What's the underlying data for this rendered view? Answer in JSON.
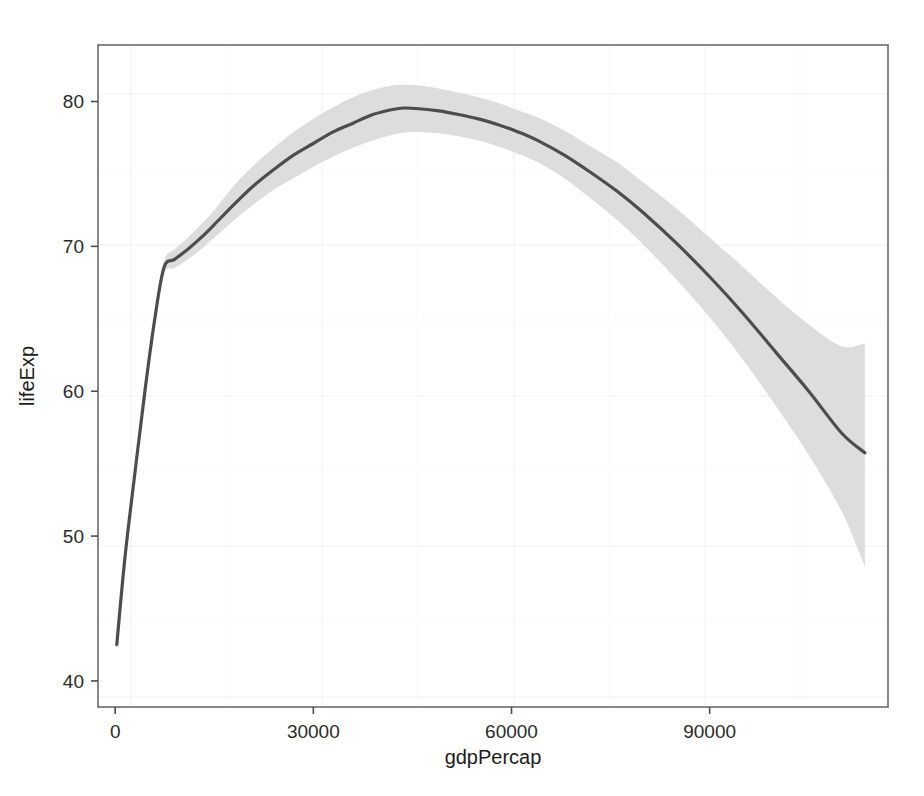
{
  "figure": {
    "background_color": "#ffffff",
    "panel_background_color": "#ffffff",
    "panel_border_color": "#6b6b6b"
  },
  "chart_data": {
    "type": "line",
    "title": "",
    "subtitle": "",
    "xlabel": "gdpPercap",
    "ylabel": "lifeExp",
    "xlim": [
      -2600,
      117000
    ],
    "ylim": [
      38.2,
      83.9
    ],
    "xticks": [
      0,
      30000,
      60000,
      90000
    ],
    "xtick_labels": [
      "0",
      "30000",
      "60000",
      "90000"
    ],
    "yticks": [
      40,
      50,
      60,
      70,
      80
    ],
    "ytick_labels": [
      "40",
      "50",
      "60",
      "70",
      "80"
    ],
    "grid": "faint major and minor gridlines, white-on-white",
    "legend": "none",
    "line_color": "#4d4d4d",
    "line_width": 3.0,
    "ribbon_color": "#d9d9d9",
    "ribbon_opacity": 0.85,
    "series": [
      {
        "name": "loess smooth (fit)",
        "x": [
          241,
          1500,
          3000,
          4500,
          6000,
          7400,
          9000,
          11000,
          13000,
          15000,
          18000,
          21000,
          24000,
          27000,
          30000,
          33000,
          36000,
          39000,
          42000,
          43700,
          46000,
          49000,
          52000,
          55000,
          58000,
          61000,
          64000,
          68000,
          72000,
          76000,
          80000,
          85000,
          90000,
          95000,
          100000,
          105000,
          110000,
          113500
        ],
        "y": [
          42.5,
          48.6,
          54.4,
          60.0,
          65.0,
          68.55,
          69.1,
          69.8,
          70.6,
          71.5,
          72.9,
          74.2,
          75.3,
          76.3,
          77.1,
          77.9,
          78.5,
          79.1,
          79.45,
          79.55,
          79.5,
          79.35,
          79.1,
          78.8,
          78.4,
          77.9,
          77.3,
          76.3,
          75.1,
          73.8,
          72.3,
          70.2,
          67.9,
          65.4,
          62.7,
          60.0,
          57.1,
          55.75
        ]
      },
      {
        "name": "confidence band upper (ymax)",
        "x": [
          241,
          1500,
          3000,
          4500,
          6000,
          7400,
          9000,
          11000,
          13000,
          15000,
          18000,
          21000,
          24000,
          27000,
          30000,
          33000,
          36000,
          39000,
          42000,
          43700,
          46000,
          49000,
          52000,
          55000,
          58000,
          61000,
          64000,
          68000,
          72000,
          76000,
          80000,
          85000,
          90000,
          95000,
          100000,
          105000,
          110000,
          113500
        ],
        "y": [
          42.6,
          48.8,
          54.6,
          60.3,
          65.4,
          69.0,
          69.8,
          70.6,
          71.5,
          72.5,
          74.2,
          75.6,
          76.8,
          77.9,
          78.8,
          79.6,
          80.3,
          80.8,
          81.1,
          81.15,
          81.1,
          80.9,
          80.6,
          80.3,
          79.9,
          79.4,
          78.9,
          78.0,
          76.9,
          75.8,
          74.4,
          72.6,
          70.6,
          68.6,
          66.5,
          64.6,
          63.1,
          63.3
        ]
      },
      {
        "name": "confidence band lower (ymin)",
        "x": [
          241,
          1500,
          3000,
          4500,
          6000,
          7400,
          9000,
          11000,
          13000,
          15000,
          18000,
          21000,
          24000,
          27000,
          30000,
          33000,
          36000,
          39000,
          42000,
          43700,
          46000,
          49000,
          52000,
          55000,
          58000,
          61000,
          64000,
          68000,
          72000,
          76000,
          80000,
          85000,
          90000,
          95000,
          100000,
          105000,
          110000,
          113500
        ],
        "y": [
          42.4,
          48.4,
          54.2,
          59.7,
          64.6,
          68.1,
          68.5,
          69.1,
          69.8,
          70.6,
          71.8,
          72.9,
          73.9,
          74.7,
          75.5,
          76.2,
          76.8,
          77.3,
          77.7,
          77.85,
          77.9,
          77.8,
          77.6,
          77.3,
          76.9,
          76.4,
          75.8,
          74.7,
          73.3,
          71.8,
          70.1,
          67.7,
          65.1,
          62.2,
          59.0,
          55.6,
          51.7,
          47.9
        ]
      }
    ],
    "annotations": [
      "Smoothed conditional mean with shaded 95% confidence ribbon",
      "Curve rises steeply from ~42.5 at low gdpPercap, shoulder near 68.6 at ~7400, peaks ~79.6 near 43700, then declines to ~55.8 at ~113500"
    ]
  }
}
